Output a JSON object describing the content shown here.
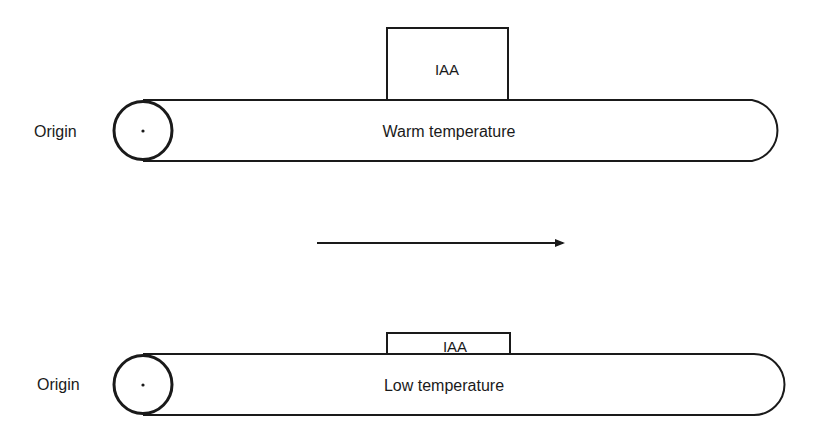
{
  "diagram": {
    "top_panel": {
      "origin_label": "Origin",
      "tube_label": "Warm temperature",
      "box_label": "IAA"
    },
    "arrow": {
      "direction": "right"
    },
    "bottom_panel": {
      "origin_label": "Origin",
      "tube_label": "Low temperature",
      "box_label": "IAA"
    },
    "colors": {
      "stroke": "#1a1a1a",
      "background": "#ffffff"
    }
  }
}
